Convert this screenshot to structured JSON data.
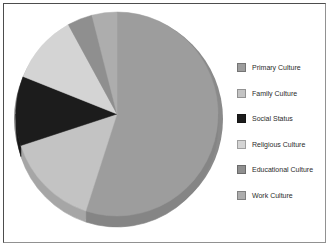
{
  "panel": {
    "background": "#ffffff",
    "border_color": "#4d4d4d"
  },
  "chart_data": {
    "type": "pie",
    "style": "3d",
    "title": "",
    "labels": [
      "Primary Culture",
      "Family Culture",
      "Social Status",
      "Religious Culture",
      "Educational Culture",
      "Work Culture"
    ],
    "values": [
      55,
      15,
      11,
      11,
      4,
      4
    ],
    "value_unit": "%",
    "values_estimated": true,
    "colors": [
      "#9d9d9d",
      "#c3c3c3",
      "#1c1c1c",
      "#d4d4d4",
      "#8f8f8f",
      "#adadad"
    ],
    "start_angle_deg": 0,
    "direction": "clockwise",
    "legend_position": "right",
    "data_labels_shown": false
  }
}
